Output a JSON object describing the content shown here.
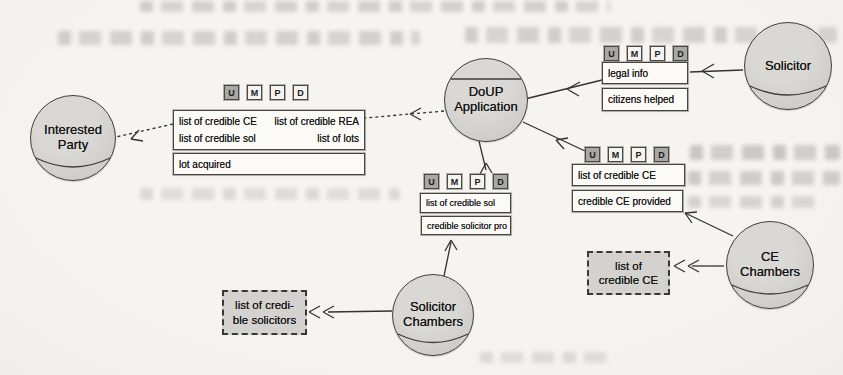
{
  "figure": {
    "tag_labels": [
      "U",
      "M",
      "P",
      "D"
    ],
    "actors": {
      "interested_party": {
        "label": "Interested Party",
        "type": "role"
      },
      "doup": {
        "label": "DoUP Application",
        "type": "agent"
      },
      "solicitor": {
        "label": "Solicitor",
        "type": "role"
      },
      "ce_chambers": {
        "label": "CE Chambers",
        "type": "role"
      },
      "solicitor_chambers": {
        "label": "Solicitor Chambers",
        "type": "role"
      }
    },
    "stacks": {
      "interested_party": {
        "tag_shaded": [
          true,
          false,
          false,
          false
        ],
        "grid": [
          "list of credible CE",
          "list of credible REA",
          "list of credible sol",
          "list of lots"
        ],
        "bottom": "lot acquired"
      },
      "legal": {
        "tag_shaded": [
          true,
          false,
          false,
          true
        ],
        "boxes": [
          "legal info",
          "citizens helped"
        ]
      },
      "credible_ce": {
        "tag_shaded": [
          true,
          false,
          false,
          true
        ],
        "boxes": [
          "list of credible CE",
          "credible CE provided"
        ]
      },
      "credible_sol": {
        "tag_shaded": [
          true,
          false,
          false,
          true
        ],
        "boxes": [
          "list of credible sol",
          "credible solicitor pro"
        ]
      }
    },
    "dashed_boxes": {
      "ce": {
        "lines": [
          "list of",
          "credible CE"
        ]
      },
      "solicitors": {
        "lines": [
          "list of credi-",
          "ble solicitors"
        ]
      }
    },
    "colors": {
      "paper": "#f4f3f0",
      "actor_fill": "#cccbc8",
      "actor_border": "#3f3e3b",
      "box_fill": "#fbfaf7",
      "box_border": "#47453f",
      "tag_shaded_fill": "#a9a8a4",
      "dashed_box_fill": "#d3d2ce",
      "connector": "#35332f"
    }
  }
}
